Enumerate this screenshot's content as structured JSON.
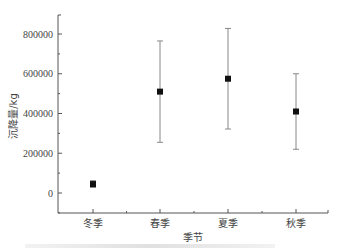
{
  "chart_data": {
    "type": "scatter",
    "subtype": "point-with-error-bars",
    "title": "",
    "xlabel": "季节",
    "ylabel": "沉降量/kg",
    "categories": [
      "冬季",
      "春季",
      "夏季",
      "秋季"
    ],
    "series": [
      {
        "name": "沉降量",
        "values": [
          45000,
          510000,
          575000,
          410000
        ],
        "error": [
          17000,
          255000,
          253000,
          190000
        ]
      }
    ],
    "yticks": [
      0,
      200000,
      400000,
      600000,
      800000
    ],
    "ytick_labels": [
      "0",
      "200000",
      "400000",
      "600000",
      "800000"
    ],
    "ylim": [
      -100000,
      900000
    ],
    "grid": false,
    "legend": "none",
    "marker": "square",
    "colors": {
      "marker": "#111111",
      "errorbar": "#888888",
      "axis": "#555555"
    }
  }
}
